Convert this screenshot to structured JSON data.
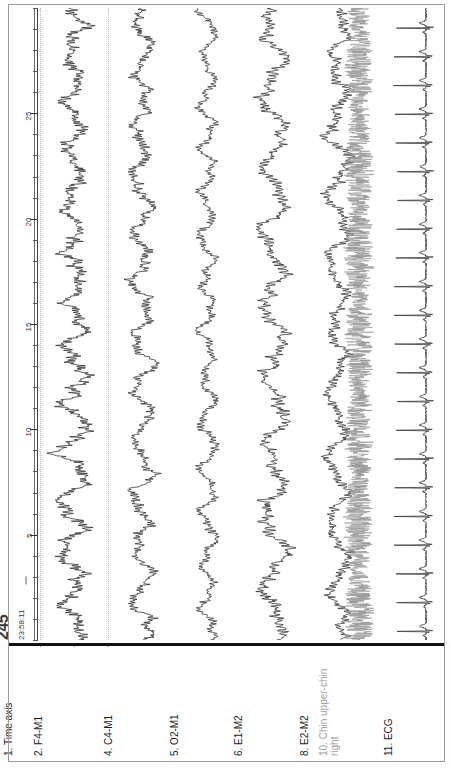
{
  "viewer": {
    "title": "Polysomnography epoch view",
    "orientation": "rotated-90"
  },
  "stamp": {
    "epoch_number": "245",
    "clock_time": "23:58:11",
    "separator": "-"
  },
  "time_axis": {
    "label": "1. Time axis",
    "unit": "s",
    "tick_labels": [
      "5",
      "10",
      "15",
      "20",
      "25"
    ],
    "tick_values": [
      5,
      10,
      15,
      20,
      25
    ],
    "range": [
      0,
      30
    ],
    "minor_step": 1
  },
  "amplitude_scale": {
    "channel_ref": "2. F4-M1",
    "markers": [
      "-37.5",
      "0",
      "37.5"
    ],
    "values": [
      -37.5,
      0,
      37.5
    ],
    "unit": "uV"
  },
  "colors": {
    "trace_dark": "#2b2b2b",
    "trace_gray": "#8f8f8f",
    "grid_dotted": "#b9b9b9",
    "rule": "#111111",
    "frame": "#9a9a9a",
    "label_muted": "#9d9d9d"
  },
  "channels": [
    {
      "index": "1",
      "label": "1. Time axis",
      "name": "Time axis",
      "kind": "axis",
      "color": "#333333",
      "muted": false
    },
    {
      "index": "2",
      "label": "2. F4-M1",
      "name": "F4-M1",
      "kind": "eeg",
      "color": "#2b2b2b",
      "muted": false
    },
    {
      "index": "4",
      "label": "4. C4-M1",
      "name": "C4-M1",
      "kind": "eeg",
      "color": "#2b2b2b",
      "muted": false
    },
    {
      "index": "5",
      "label": "5. O2-M1",
      "name": "O2-M1",
      "kind": "eeg",
      "color": "#2b2b2b",
      "muted": false
    },
    {
      "index": "6",
      "label": "6. E1-M2",
      "name": "E1-M2",
      "kind": "eog",
      "color": "#2b2b2b",
      "muted": false
    },
    {
      "index": "8",
      "label": "8. E2-M2",
      "name": "E2-M2",
      "kind": "eog",
      "color": "#2b2b2b",
      "muted": false
    },
    {
      "index": "10",
      "label": "10. Chin upper-chin right",
      "name": "Chin upper-chin right",
      "kind": "emg",
      "color": "#8f8f8f",
      "muted": true
    },
    {
      "index": "11",
      "label": "11. ECG",
      "name": "ECG",
      "kind": "ecg",
      "color": "#3a3a3a",
      "muted": false
    }
  ],
  "chart_data": {
    "type": "line",
    "xlabel": "Time axis (s)",
    "ylabel": "Amplitude (uV)",
    "xlim": [
      0,
      30
    ],
    "grid": true,
    "legend_position": "none",
    "x_tick_labels": [
      "5",
      "10",
      "15",
      "20",
      "25"
    ],
    "epoch_length_s": 30,
    "series": [
      {
        "name": "2. F4-M1",
        "kind": "eeg",
        "color": "#2b2b2b",
        "ylim": [
          -37.5,
          37.5
        ],
        "y_tick_labels": [
          "-37.5",
          "0",
          "37.5"
        ],
        "amplitude": 1.0,
        "noise": 0.62,
        "seed": 11,
        "slow_freq": 0.42,
        "fast_freq": 9.0
      },
      {
        "name": "4. C4-M1",
        "kind": "eeg",
        "color": "#2b2b2b",
        "amplitude": 0.92,
        "noise": 0.5,
        "seed": 23,
        "slow_freq": 0.4,
        "fast_freq": 8.0
      },
      {
        "name": "5. O2-M1",
        "kind": "eeg",
        "color": "#2b2b2b",
        "amplitude": 0.8,
        "noise": 0.4,
        "seed": 37,
        "slow_freq": 0.46,
        "fast_freq": 7.0
      },
      {
        "name": "6. E1-M2",
        "kind": "eog",
        "color": "#2b2b2b",
        "amplitude": 1.05,
        "noise": 0.46,
        "seed": 53,
        "slow_freq": 0.3,
        "fast_freq": 6.0
      },
      {
        "name": "8. E2-M2",
        "kind": "eog",
        "color": "#2b2b2b",
        "amplitude": 0.98,
        "noise": 0.44,
        "seed": 71,
        "slow_freq": 0.32,
        "fast_freq": 6.5
      },
      {
        "name": "10. Chin upper-chin right",
        "kind": "emg",
        "color": "#8f8f8f",
        "amplitude": 0.85,
        "noise": 1.0,
        "seed": 97,
        "slow_freq": 0.0,
        "fast_freq": 38.0
      },
      {
        "name": "11. ECG",
        "kind": "ecg",
        "color": "#3a3a3a",
        "amplitude": 1.0,
        "noise": 0.05,
        "seed": 131,
        "beats": 22,
        "heart_rate_bpm": 44
      }
    ]
  }
}
